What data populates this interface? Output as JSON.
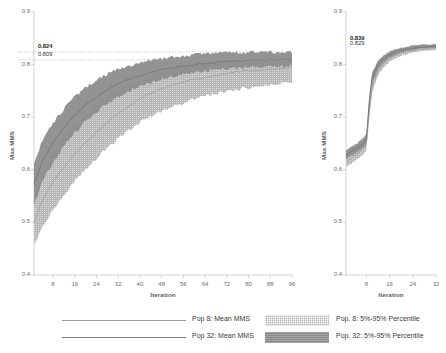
{
  "chart_data": [
    {
      "id": "left-panel",
      "type": "line",
      "title": "",
      "xlabel": "Iteration",
      "ylabel": "Max MMS",
      "xlim": [
        1,
        96
      ],
      "ylim": [
        0.4,
        0.9
      ],
      "xticks": [
        8,
        16,
        24,
        32,
        40,
        48,
        56,
        64,
        72,
        80,
        88,
        96
      ],
      "yticks": [
        "0.4",
        "0.5",
        "0.6",
        "0.7",
        "0.8",
        "0.9"
      ],
      "grid": false,
      "legend_position": "below-figure",
      "annotations": [
        {
          "label": "0.824",
          "value": 0.824,
          "bold": true,
          "style": "dotted-reference-line"
        },
        {
          "label": "0.809",
          "value": 0.809,
          "bold": false,
          "style": "dotted-reference-line"
        }
      ],
      "x": [
        1,
        4,
        8,
        12,
        16,
        20,
        24,
        28,
        32,
        36,
        40,
        44,
        48,
        52,
        56,
        60,
        64,
        68,
        72,
        76,
        80,
        84,
        88,
        92,
        96
      ],
      "series": [
        {
          "name": "Pop 8: Mean MMS",
          "kind": "mean-line",
          "color": "#9a9a9a",
          "values": [
            0.5,
            0.543,
            0.578,
            0.606,
            0.63,
            0.652,
            0.672,
            0.69,
            0.707,
            0.722,
            0.735,
            0.745,
            0.754,
            0.761,
            0.767,
            0.772,
            0.776,
            0.78,
            0.783,
            0.786,
            0.788,
            0.79,
            0.792,
            0.793,
            0.794
          ]
        },
        {
          "name": "Pop 32: Mean MMS",
          "kind": "mean-line",
          "color": "#6f6f6f",
          "values": [
            0.573,
            0.615,
            0.651,
            0.68,
            0.703,
            0.723,
            0.739,
            0.752,
            0.763,
            0.772,
            0.779,
            0.785,
            0.79,
            0.794,
            0.797,
            0.8,
            0.802,
            0.804,
            0.806,
            0.807,
            0.808,
            0.809,
            0.809,
            0.809,
            0.809
          ]
        },
        {
          "name": "Pop. 8: 5%-95% Percentile",
          "kind": "band",
          "color": "#b8b8b8",
          "lower": [
            0.455,
            0.492,
            0.524,
            0.552,
            0.578,
            0.601,
            0.622,
            0.641,
            0.659,
            0.676,
            0.69,
            0.702,
            0.712,
            0.721,
            0.728,
            0.735,
            0.74,
            0.745,
            0.749,
            0.753,
            0.756,
            0.759,
            0.761,
            0.763,
            0.764
          ],
          "upper": [
            0.546,
            0.594,
            0.631,
            0.66,
            0.683,
            0.703,
            0.721,
            0.737,
            0.751,
            0.763,
            0.773,
            0.781,
            0.788,
            0.793,
            0.797,
            0.801,
            0.804,
            0.806,
            0.808,
            0.81,
            0.811,
            0.812,
            0.813,
            0.814,
            0.815
          ]
        },
        {
          "name": "Pop. 32: 5%-95% Percentile",
          "kind": "band",
          "color": "#8d8d8d",
          "lower": [
            0.532,
            0.576,
            0.614,
            0.645,
            0.67,
            0.692,
            0.71,
            0.726,
            0.739,
            0.75,
            0.759,
            0.766,
            0.772,
            0.777,
            0.781,
            0.785,
            0.788,
            0.79,
            0.792,
            0.794,
            0.795,
            0.796,
            0.797,
            0.798,
            0.798
          ],
          "upper": [
            0.612,
            0.654,
            0.689,
            0.716,
            0.738,
            0.756,
            0.771,
            0.782,
            0.791,
            0.798,
            0.804,
            0.808,
            0.812,
            0.815,
            0.817,
            0.819,
            0.82,
            0.821,
            0.822,
            0.823,
            0.823,
            0.824,
            0.824,
            0.824,
            0.824
          ]
        }
      ]
    },
    {
      "id": "right-panel",
      "type": "line",
      "title": "",
      "xlabel": "Iteration",
      "ylabel": "Max MMS",
      "xlim": [
        1,
        32
      ],
      "ylim": [
        0.4,
        0.9
      ],
      "xticks": [
        8,
        16,
        24,
        32
      ],
      "yticks": [
        "0.4",
        "0.5",
        "0.6",
        "0.7",
        "0.8",
        "0.9"
      ],
      "grid": false,
      "annotations": [
        {
          "label": "0.839",
          "value": 0.839,
          "bold": true,
          "style": "text-only"
        },
        {
          "label": "0.829",
          "value": 0.829,
          "bold": false,
          "style": "text-only"
        }
      ],
      "x": [
        1,
        3,
        5,
        7,
        8,
        9,
        10,
        12,
        14,
        16,
        18,
        20,
        22,
        24,
        26,
        28,
        30,
        32
      ],
      "series": [
        {
          "name": "Pop 8: Mean MMS",
          "kind": "mean-line",
          "color": "#9a9a9a",
          "values": [
            0.615,
            0.623,
            0.631,
            0.64,
            0.648,
            0.712,
            0.76,
            0.789,
            0.803,
            0.812,
            0.818,
            0.822,
            0.825,
            0.827,
            0.829,
            0.83,
            0.831,
            0.832
          ]
        },
        {
          "name": "Pop 32: Mean MMS",
          "kind": "mean-line",
          "color": "#6f6f6f",
          "values": [
            0.628,
            0.635,
            0.642,
            0.65,
            0.657,
            0.728,
            0.775,
            0.8,
            0.812,
            0.819,
            0.824,
            0.827,
            0.829,
            0.831,
            0.832,
            0.833,
            0.834,
            0.834
          ]
        },
        {
          "name": "Pop. 8: 5%-95% Percentile",
          "kind": "band",
          "color": "#b8b8b8",
          "lower": [
            0.606,
            0.613,
            0.621,
            0.629,
            0.637,
            0.696,
            0.746,
            0.779,
            0.795,
            0.805,
            0.812,
            0.817,
            0.82,
            0.823,
            0.825,
            0.826,
            0.827,
            0.828
          ],
          "upper": [
            0.627,
            0.634,
            0.642,
            0.651,
            0.659,
            0.727,
            0.772,
            0.797,
            0.81,
            0.818,
            0.823,
            0.827,
            0.83,
            0.832,
            0.833,
            0.835,
            0.836,
            0.837
          ]
        },
        {
          "name": "Pop. 32: 5%-95% Percentile",
          "kind": "band",
          "color": "#8d8d8d",
          "lower": [
            0.62,
            0.627,
            0.634,
            0.642,
            0.65,
            0.715,
            0.763,
            0.791,
            0.805,
            0.813,
            0.819,
            0.823,
            0.826,
            0.828,
            0.83,
            0.831,
            0.832,
            0.832
          ],
          "upper": [
            0.637,
            0.644,
            0.651,
            0.66,
            0.668,
            0.74,
            0.785,
            0.807,
            0.818,
            0.825,
            0.829,
            0.832,
            0.834,
            0.836,
            0.837,
            0.838,
            0.838,
            0.839
          ]
        }
      ]
    }
  ],
  "legend": {
    "entries": [
      {
        "label": "Pop 8: Mean MMS",
        "type": "line",
        "color": "#9a9a9a"
      },
      {
        "label": "Pop 32: Mean MMS",
        "type": "line",
        "color": "#7d7d7d"
      },
      {
        "label": "Pop. 8: 5%-95% Percentile",
        "type": "band",
        "color": "#b8b8b8"
      },
      {
        "label": "Pop. 32: 5%-95% Percentile",
        "type": "band",
        "color": "#8d8d8d"
      }
    ]
  },
  "colors": {
    "axis": "#c8c8c8",
    "tick_text": "#6e6e6e",
    "pop8_line": "#9a9a9a",
    "pop32_line": "#6f6f6f",
    "pop8_band": "#b8b8b8",
    "pop32_band": "#8d8d8d",
    "reference_line": "#a9a9a9"
  }
}
